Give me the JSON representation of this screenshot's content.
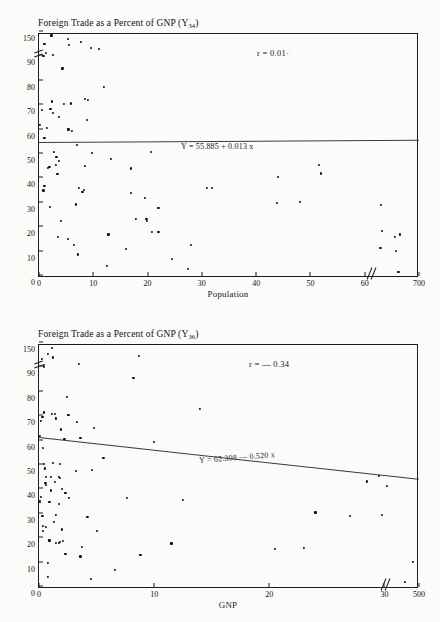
{
  "page": {
    "background": "#fbfbf9",
    "ink": "#111111"
  },
  "figures": [
    {
      "id": "figure-1",
      "title": "Foreign Trade as a Percent of GNP (Y",
      "title_sub": "34",
      "title_close": ")",
      "r_label": "r = 0.01·",
      "equation": "Y = 55.885 + 0.013 x",
      "xlabel": "Population",
      "ylabel": "",
      "yticks": [
        "0",
        "10",
        "20",
        "30",
        "40",
        "50",
        "60",
        "70",
        "80",
        "90",
        "150"
      ],
      "xticks": [
        "0",
        "10",
        "20",
        "30",
        "40",
        "50",
        "60",
        "700"
      ]
    },
    {
      "id": "figure-2",
      "title": "Foreign Trade as a Percent of GNP (Y",
      "title_sub": "36",
      "title_close": ")",
      "r_label": "r = — 0.34",
      "equation": "Y = 62.308 — 0.520 x",
      "xlabel": "GNP",
      "ylabel": "",
      "yticks": [
        "0",
        "10",
        "20",
        "30",
        "40",
        "50",
        "60",
        "70",
        "80",
        "90",
        "150"
      ],
      "xticks": [
        "0",
        "10",
        "20",
        "30",
        "40",
        "500"
      ]
    }
  ],
  "chart_data": [
    {
      "type": "scatter",
      "title": "Foreign Trade as a Percent of GNP (Y34)",
      "xlabel": "Population",
      "ylabel": "Foreign Trade as a Percent of GNP",
      "xlim": [
        0,
        70
      ],
      "ylim": [
        0,
        100
      ],
      "x_axis_break_after": 61,
      "x_tick_values": [
        0,
        10,
        20,
        30,
        40,
        50,
        60,
        70
      ],
      "x_tick_labels": [
        "0",
        "10",
        "20",
        "30",
        "40",
        "50",
        "60",
        "700"
      ],
      "y_tick_values": [
        0,
        10,
        20,
        30,
        40,
        50,
        60,
        70,
        80,
        90,
        100
      ],
      "y_tick_labels": [
        "0",
        "10",
        "20",
        "30",
        "40",
        "50",
        "60",
        "70",
        "80",
        "90",
        "150"
      ],
      "y_axis_break_after": 92,
      "grid": false,
      "annotations": [
        "r = 0.01·",
        "Y = 55.885 + 0.013 x"
      ],
      "regression": {
        "intercept": 55.885,
        "slope": 0.013,
        "r": 0.01
      },
      "points": [
        [
          2.3,
          98.5
        ],
        [
          1.0,
          95.0
        ],
        [
          5.3,
          97.0
        ],
        [
          7.7,
          96.0
        ],
        [
          5.5,
          94.5
        ],
        [
          9.5,
          93.5
        ],
        [
          11.0,
          93.0
        ],
        [
          1.3,
          91.5
        ],
        [
          0.8,
          90.0
        ],
        [
          2.6,
          90.5
        ],
        [
          4.3,
          85.0
        ],
        [
          12.0,
          77.5
        ],
        [
          2.4,
          71.5
        ],
        [
          4.6,
          70.5
        ],
        [
          5.9,
          70.7
        ],
        [
          8.5,
          72.5
        ],
        [
          9.0,
          72.0
        ],
        [
          0.6,
          68.0
        ],
        [
          2.1,
          68.3
        ],
        [
          2.5,
          66.8
        ],
        [
          3.6,
          65.0
        ],
        [
          8.8,
          64.0
        ],
        [
          0.2,
          62.0
        ],
        [
          1.4,
          60.7
        ],
        [
          5.4,
          60.0
        ],
        [
          6.1,
          59.3
        ],
        [
          1.0,
          56.5
        ],
        [
          7.0,
          53.5
        ],
        [
          9.8,
          50.5
        ],
        [
          20.6,
          50.8
        ],
        [
          2.8,
          50.8
        ],
        [
          3.2,
          48.8
        ],
        [
          13.2,
          48.0
        ],
        [
          3.6,
          47.2
        ],
        [
          3.1,
          45.5
        ],
        [
          8.5,
          45.0
        ],
        [
          17.0,
          44.0
        ],
        [
          1.6,
          44.3
        ],
        [
          1.9,
          44.7
        ],
        [
          3.4,
          41.8
        ],
        [
          51.5,
          45.5
        ],
        [
          52.0,
          42.0
        ],
        [
          44.0,
          40.7
        ],
        [
          1.0,
          37.0
        ],
        [
          7.3,
          36.2
        ],
        [
          31.0,
          36.0
        ],
        [
          31.8,
          36.0
        ],
        [
          8.3,
          35.3
        ],
        [
          0.8,
          35.0
        ],
        [
          8.0,
          34.5
        ],
        [
          17.0,
          34.0
        ],
        [
          19.5,
          31.8
        ],
        [
          48.0,
          30.2
        ],
        [
          43.8,
          29.8
        ],
        [
          63.0,
          29.0
        ],
        [
          6.8,
          29.3
        ],
        [
          2.0,
          28.2
        ],
        [
          22.0,
          28.0
        ],
        [
          17.8,
          23.2
        ],
        [
          19.8,
          23.3
        ],
        [
          19.9,
          22.6
        ],
        [
          4.0,
          22.5
        ],
        [
          20.8,
          18.0
        ],
        [
          22.0,
          18.0
        ],
        [
          63.2,
          18.5
        ],
        [
          12.8,
          17.0
        ],
        [
          66.5,
          17.0
        ],
        [
          65.5,
          16.0
        ],
        [
          3.5,
          15.8
        ],
        [
          5.3,
          15.2
        ],
        [
          6.5,
          12.6
        ],
        [
          28.0,
          12.8
        ],
        [
          16.0,
          11.0
        ],
        [
          62.9,
          11.5
        ],
        [
          65.8,
          10.2
        ],
        [
          7.2,
          8.8
        ],
        [
          24.5,
          6.8
        ],
        [
          12.5,
          4.0
        ],
        [
          27.5,
          2.7
        ],
        [
          66.2,
          1.7
        ]
      ]
    },
    {
      "type": "scatter",
      "title": "Foreign Trade as a Percent of GNP (Y36)",
      "xlabel": "GNP",
      "ylabel": "Foreign Trade as a Percent of GNP",
      "xlim": [
        0,
        33
      ],
      "ylim": [
        0,
        100
      ],
      "x_axis_break_after": 30,
      "x_tick_values": [
        0,
        10,
        20,
        30,
        33
      ],
      "x_tick_labels": [
        "0",
        "10",
        "20",
        "30",
        "500"
      ],
      "y_tick_values": [
        0,
        10,
        20,
        30,
        40,
        50,
        60,
        70,
        80,
        90,
        100
      ],
      "y_tick_labels": [
        "0",
        "10",
        "20",
        "30",
        "40",
        "50",
        "60",
        "70",
        "80",
        "90",
        "150"
      ],
      "y_axis_break_after": 92,
      "grid": false,
      "annotations": [
        "r = — 0.34",
        "Y = 62.308 — 0.520 x"
      ],
      "regression": {
        "intercept": 62.308,
        "slope": -0.52,
        "r": -0.34
      },
      "points": [
        [
          1.1,
          98.0
        ],
        [
          0.8,
          95.5
        ],
        [
          1.2,
          94.0
        ],
        [
          0.25,
          93.5
        ],
        [
          8.7,
          94.5
        ],
        [
          0.4,
          91.0
        ],
        [
          3.5,
          91.5
        ],
        [
          0.45,
          90.0
        ],
        [
          8.2,
          85.5
        ],
        [
          2.4,
          78.0
        ],
        [
          0.45,
          71.5
        ],
        [
          1.1,
          71.0
        ],
        [
          1.35,
          70.8
        ],
        [
          2.55,
          70.5
        ],
        [
          0.3,
          69.5
        ],
        [
          1.5,
          69.0
        ],
        [
          14.0,
          73.0
        ],
        [
          0.2,
          68.0
        ],
        [
          3.3,
          67.5
        ],
        [
          1.9,
          64.5
        ],
        [
          4.8,
          65.0
        ],
        [
          2.2,
          60.5
        ],
        [
          3.6,
          61.0
        ],
        [
          0.1,
          62.0
        ],
        [
          10.0,
          59.5
        ],
        [
          0.35,
          57.0
        ],
        [
          0.45,
          50.5
        ],
        [
          1.2,
          50.8
        ],
        [
          1.85,
          50.5
        ],
        [
          5.6,
          53.0
        ],
        [
          0.5,
          48.5
        ],
        [
          3.2,
          47.5
        ],
        [
          4.6,
          48.0
        ],
        [
          0.6,
          45.2
        ],
        [
          1.0,
          45.0
        ],
        [
          1.7,
          45.0
        ],
        [
          1.85,
          44.8
        ],
        [
          1.4,
          43.0
        ],
        [
          0.55,
          42.5
        ],
        [
          0.6,
          41.8
        ],
        [
          28.5,
          43.2
        ],
        [
          29.5,
          45.5
        ],
        [
          30.2,
          41.2
        ],
        [
          2.0,
          40.0
        ],
        [
          1.05,
          39.5
        ],
        [
          2.3,
          38.5
        ],
        [
          2.6,
          36.5
        ],
        [
          7.6,
          36.3
        ],
        [
          12.5,
          35.5
        ],
        [
          0.2,
          37.0
        ],
        [
          0.1,
          35.0
        ],
        [
          0.9,
          34.8
        ],
        [
          1.7,
          34.0
        ],
        [
          24.0,
          30.5
        ],
        [
          27.0,
          29.0
        ],
        [
          29.8,
          29.5
        ],
        [
          1.45,
          29.5
        ],
        [
          0.3,
          29.0
        ],
        [
          4.2,
          28.5
        ],
        [
          1.3,
          26.5
        ],
        [
          0.35,
          25.0
        ],
        [
          0.6,
          24.5
        ],
        [
          0.35,
          23.0
        ],
        [
          2.0,
          23.5
        ],
        [
          5.0,
          23.0
        ],
        [
          1.5,
          18.0
        ],
        [
          1.75,
          18.0
        ],
        [
          1.85,
          18.3
        ],
        [
          2.05,
          18.8
        ],
        [
          11.5,
          17.8
        ],
        [
          20.5,
          15.5
        ],
        [
          23.0,
          16.0
        ],
        [
          3.7,
          16.5
        ],
        [
          0.9,
          19.0
        ],
        [
          2.3,
          13.5
        ],
        [
          3.6,
          12.5
        ],
        [
          8.8,
          13.2
        ],
        [
          0.75,
          9.8
        ],
        [
          32.5,
          10.3
        ],
        [
          6.6,
          7.0
        ],
        [
          4.5,
          3.2
        ],
        [
          0.8,
          4.0
        ],
        [
          31.8,
          2.0
        ]
      ]
    }
  ]
}
